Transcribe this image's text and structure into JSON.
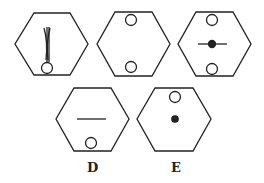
{
  "figure": {
    "stroke_color": "#222222",
    "fill_color": "#ffffff",
    "hexagons": [
      {
        "id": "hex-1",
        "contents": [
          "vertical-curved-lines",
          "circle-bottom"
        ]
      },
      {
        "id": "hex-2",
        "contents": [
          "circle-top",
          "circle-bottom"
        ]
      },
      {
        "id": "hex-3",
        "contents": [
          "circle-top",
          "dot-with-horizontal-line-center",
          "circle-bottom"
        ]
      },
      {
        "id": "hex-D",
        "contents": [
          "horizontal-line-center",
          "circle-bottom"
        ]
      },
      {
        "id": "hex-E",
        "contents": [
          "circle-top",
          "dot-center"
        ]
      }
    ],
    "labels": {
      "d": "D",
      "e": "E"
    }
  }
}
